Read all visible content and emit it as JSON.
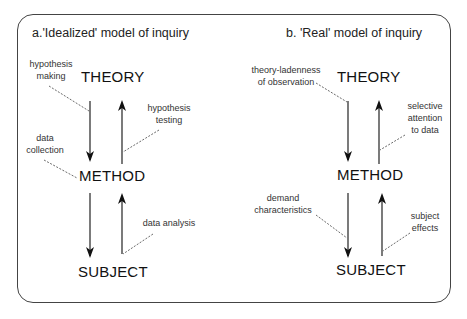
{
  "diagram": {
    "panels": [
      {
        "title": "a.'Idealized' model of inquiry",
        "nodes": {
          "top": "THEORY",
          "middle": "METHOD",
          "bottom": "SUBJECT"
        },
        "labels": {
          "theory_to_method": "hypothesis making",
          "theory_to_method_lines": [
            "hypothesis",
            "making"
          ],
          "method_to_theory_lines": [
            "hypothesis",
            "testing"
          ],
          "method_down_lines": [
            "data",
            "collection"
          ],
          "subject_to_method": "data analysis"
        }
      },
      {
        "title": "b. 'Real' model of inquiry",
        "nodes": {
          "top": "THEORY",
          "middle": "METHOD",
          "bottom": "SUBJECT"
        },
        "labels": {
          "theory_to_method_lines": [
            "theory-ladenness",
            "of observation"
          ],
          "method_to_theory_lines": [
            "selective",
            "attention",
            "to data"
          ],
          "method_to_subject_lines": [
            "demand",
            "characteristics"
          ],
          "subject_to_method_lines": [
            "subject",
            "effects"
          ]
        }
      }
    ],
    "colors": {
      "line": "#222222",
      "frame": "#444444",
      "text": "#111111"
    }
  }
}
